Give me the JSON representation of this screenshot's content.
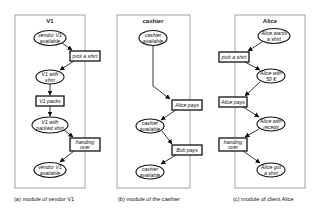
{
  "modules": [
    {
      "title": "V1",
      "caption": "(a) module of vendor V1",
      "nodes": {
        "s1": {
          "line1": "vendor V1",
          "line2": "available"
        },
        "t1": {
          "label": "pick a shirt"
        },
        "s2": {
          "line1": "V1 with",
          "line2": "shirt"
        },
        "t2": {
          "label": "V1 packs"
        },
        "s3": {
          "line1": "V1 with",
          "line2": "packed shirt"
        },
        "t3": {
          "line1": "handing",
          "line2": "over"
        },
        "s4": {
          "line1": "vendor V1",
          "line2": "available"
        }
      }
    },
    {
      "title": "cashier",
      "caption": "(b) module of the cashier",
      "nodes": {
        "s1": {
          "line1": "cashier",
          "line2": "available"
        },
        "t1": {
          "label": "Alice pays"
        },
        "s2": {
          "line1": "cashier",
          "line2": "available"
        },
        "t2": {
          "label": "Bob pays"
        },
        "s3": {
          "line1": "cashier",
          "line2": "available"
        }
      }
    },
    {
      "title": "Alice",
      "caption": "(c) module of client Alice",
      "nodes": {
        "s1": {
          "line1": "Alice wants",
          "line2": "a shirt"
        },
        "t1": {
          "label": "pick a shirt"
        },
        "s2": {
          "line1": "Alice with",
          "line2": "50 €"
        },
        "t2": {
          "label": "Alice pays"
        },
        "s3": {
          "line1": "Alice with",
          "line2": "receipt"
        },
        "t3": {
          "line1": "handing",
          "line2": "over"
        },
        "s4": {
          "line1": "Alice got",
          "line2": "a shirt"
        }
      }
    }
  ],
  "colors": {
    "stroke": "#111111",
    "frame": "#8a8a8a",
    "background": "#ffffff"
  }
}
